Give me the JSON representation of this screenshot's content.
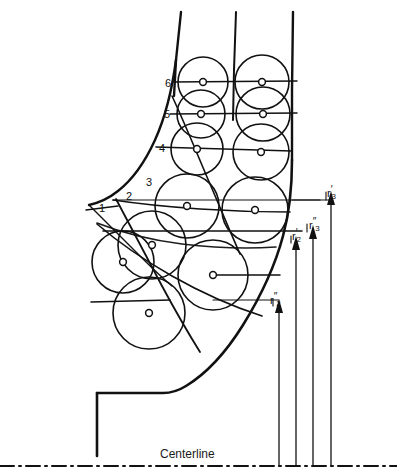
{
  "figure": {
    "type": "engineering-drawing",
    "background_color": "#ffffff",
    "line_color": "#111111"
  },
  "station_labels": [
    {
      "id": "1",
      "text": "1",
      "x": 99,
      "y": 202
    },
    {
      "id": "2",
      "text": "2",
      "x": 126,
      "y": 190
    },
    {
      "id": "3",
      "text": "3",
      "x": 146,
      "y": 176
    },
    {
      "id": "4",
      "text": "4",
      "x": 159,
      "y": 142
    },
    {
      "id": "5",
      "text": "5",
      "x": 164,
      "y": 108
    },
    {
      "id": "6",
      "text": "6",
      "x": 165,
      "y": 77
    }
  ],
  "radius_labels": [
    {
      "id": "r-prime-3",
      "symbol": "r",
      "primes": "′",
      "subscript": "3",
      "x": 327,
      "y": 188
    },
    {
      "id": "r-double-prime-3",
      "symbol": "r",
      "primes": "″",
      "subscript": "3",
      "x": 309,
      "y": 220
    },
    {
      "id": "r-prime-2",
      "symbol": "r",
      "primes": "′",
      "subscript": "2",
      "x": 292,
      "y": 231
    },
    {
      "id": "r-double-prime-2",
      "symbol": "r",
      "primes": "″",
      "subscript": "2",
      "x": 270,
      "y": 295
    }
  ],
  "centerline": {
    "label": "Centerline",
    "label_x": 160,
    "label_y": 447,
    "y": 466
  },
  "circles": [
    {
      "cx": 203,
      "cy": 82,
      "r": 25
    },
    {
      "cx": 262,
      "cy": 82,
      "r": 27
    },
    {
      "cx": 201,
      "cy": 114,
      "r": 24
    },
    {
      "cx": 263,
      "cy": 114,
      "r": 27
    },
    {
      "cx": 197,
      "cy": 149,
      "r": 26
    },
    {
      "cx": 261,
      "cy": 152,
      "r": 28
    },
    {
      "cx": 187,
      "cy": 206,
      "r": 32
    },
    {
      "cx": 255,
      "cy": 210,
      "r": 33
    },
    {
      "cx": 152,
      "cy": 245,
      "r": 34
    },
    {
      "cx": 213,
      "cy": 275,
      "r": 35
    },
    {
      "cx": 123,
      "cy": 262,
      "r": 31
    },
    {
      "cx": 149,
      "cy": 313,
      "r": 36
    }
  ],
  "center_markers": [
    {
      "cx": 203,
      "cy": 82
    },
    {
      "cx": 262,
      "cy": 82
    },
    {
      "cx": 201,
      "cy": 114
    },
    {
      "cx": 263,
      "cy": 114
    },
    {
      "cx": 197,
      "cy": 149
    },
    {
      "cx": 261,
      "cy": 152
    },
    {
      "cx": 187,
      "cy": 206
    },
    {
      "cx": 255,
      "cy": 210
    },
    {
      "cx": 152,
      "cy": 245
    },
    {
      "cx": 213,
      "cy": 275
    },
    {
      "cx": 123,
      "cy": 262
    },
    {
      "cx": 149,
      "cy": 313
    }
  ]
}
